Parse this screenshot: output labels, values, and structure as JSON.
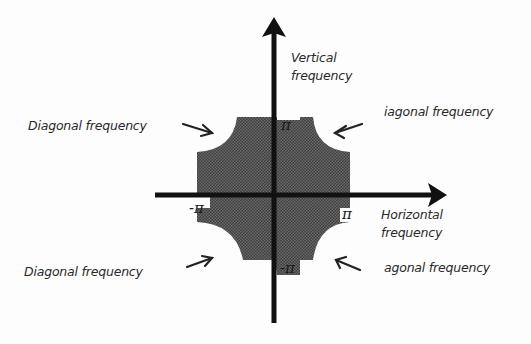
{
  "diagram": {
    "type": "2D frequency support diagram",
    "axes": {
      "vertical_label_line1": "Vertical",
      "vertical_label_line2": "frequency",
      "horizontal_label_line1": "Horizontal",
      "horizontal_label_line2": "frequency"
    },
    "ticks": {
      "top": "π",
      "bottom": "-π",
      "left": "-π",
      "right": "π"
    },
    "annotations": {
      "top_left": "Diagonal frequency",
      "top_right": "iagonal frequency",
      "bottom_left": "Diagonal frequency",
      "bottom_right": "agonal frequency"
    },
    "colors": {
      "region_fill": "#4a4a4a",
      "axis": "#111111",
      "background": "#fdfdfd"
    }
  }
}
